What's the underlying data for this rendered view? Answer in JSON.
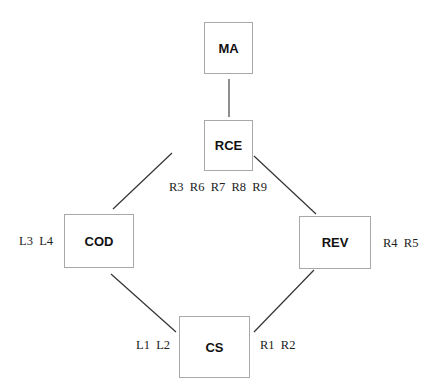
{
  "diagram": {
    "nodes": [
      {
        "id": "MA",
        "label": "MA"
      },
      {
        "id": "RCE",
        "label": "RCE"
      },
      {
        "id": "COD",
        "label": "COD"
      },
      {
        "id": "REV",
        "label": "REV"
      },
      {
        "id": "CS",
        "label": "CS"
      }
    ],
    "edges": [
      {
        "from": "MA",
        "to": "RCE"
      },
      {
        "from": "RCE",
        "to": "COD"
      },
      {
        "from": "RCE",
        "to": "REV"
      },
      {
        "from": "COD",
        "to": "CS"
      },
      {
        "from": "REV",
        "to": "CS"
      }
    ],
    "annotations": {
      "rce": "R3  R6  R7  R8  R9",
      "cod": "L3  L4",
      "rev": "R4  R5",
      "cs_left": "L1  L2",
      "cs_right": "R1  R2"
    },
    "colors": {
      "box_border": "#a8a8a8",
      "edge": "#333333"
    }
  }
}
